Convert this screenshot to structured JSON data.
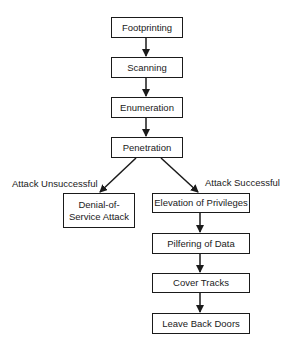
{
  "diagram": {
    "type": "flowchart",
    "nodes": {
      "footprinting": "Footprinting",
      "scanning": "Scanning",
      "enumeration": "Enumeration",
      "penetration": "Penetration",
      "dos_line1": "Denial-of-",
      "dos_line2": "Service Attack",
      "elevation": "Elevation of Privileges",
      "pilfering": "Pilfering of Data",
      "cover_tracks": "Cover Tracks",
      "back_doors": "Leave Back Doors"
    },
    "edge_labels": {
      "unsuccessful": "Attack Unsuccessful",
      "successful": "Attack Successful"
    },
    "edges": [
      [
        "Footprinting",
        "Scanning"
      ],
      [
        "Scanning",
        "Enumeration"
      ],
      [
        "Enumeration",
        "Penetration"
      ],
      [
        "Penetration",
        "Denial-of-Service Attack"
      ],
      [
        "Penetration",
        "Elevation of Privileges"
      ],
      [
        "Elevation of Privileges",
        "Pilfering of Data"
      ],
      [
        "Pilfering of Data",
        "Cover Tracks"
      ],
      [
        "Cover Tracks",
        "Leave Back Doors"
      ]
    ]
  }
}
